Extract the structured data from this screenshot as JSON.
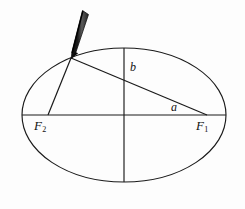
{
  "figure": {
    "name": "ellipse-string-construction",
    "background_color": "#fdfdfd",
    "ink_color": "#1a1a1a",
    "pencil_color": "#111111"
  },
  "labels": {
    "focus_right": {
      "text": "F",
      "subscript": "1"
    },
    "focus_left": {
      "text": "F",
      "subscript": "2"
    },
    "semi_minor": {
      "text": "b"
    },
    "semi_major": {
      "text": "a"
    }
  },
  "geometry": {
    "center": {
      "x": 124,
      "y": 115
    },
    "semi_major_axis_px": 102,
    "semi_minor_axis_px": 67,
    "focus_right": {
      "x": 207,
      "y": 115
    },
    "focus_left": {
      "x": 48,
      "y": 115
    },
    "pencil_point": {
      "x": 71,
      "y": 58
    },
    "pencil_top": {
      "x": 86,
      "y": 12
    },
    "major_axis_endpoints": [
      {
        "x": 22,
        "y": 115
      },
      {
        "x": 226,
        "y": 115
      }
    ],
    "minor_axis_endpoints": [
      {
        "x": 124,
        "y": 48
      },
      {
        "x": 124,
        "y": 182
      }
    ]
  }
}
